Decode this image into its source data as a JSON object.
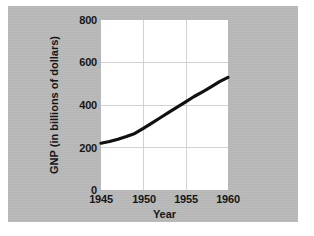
{
  "figure": {
    "background_color": "#ffffff",
    "panel_color": "#b9b9b9",
    "plot_background_color": "#ffffff",
    "grid_color": "#d2d2d2",
    "line_color": "#111111"
  },
  "chart_data": {
    "type": "line",
    "title": "",
    "xlabel": "Year",
    "ylabel": "GNP (in billions of dollars)",
    "xlim": [
      1945,
      1960
    ],
    "ylim": [
      0,
      800
    ],
    "xticks": [
      "1945",
      "1950",
      "1955",
      "1960"
    ],
    "yticks": [
      "0",
      "200",
      "400",
      "600",
      "800"
    ],
    "xtick_values": [
      1945,
      1950,
      1955,
      1960
    ],
    "ytick_values": [
      0,
      200,
      400,
      600,
      800
    ],
    "grid": true,
    "legend": "none",
    "series": [
      {
        "name": "GNP",
        "x": [
          1945,
          1946,
          1947,
          1948,
          1949,
          1950,
          1951,
          1952,
          1953,
          1954,
          1955,
          1956,
          1957,
          1958,
          1959,
          1960
        ],
        "values": [
          220,
          228,
          239,
          252,
          266,
          290,
          315,
          340,
          365,
          390,
          415,
          440,
          462,
          485,
          510,
          530
        ]
      }
    ]
  }
}
